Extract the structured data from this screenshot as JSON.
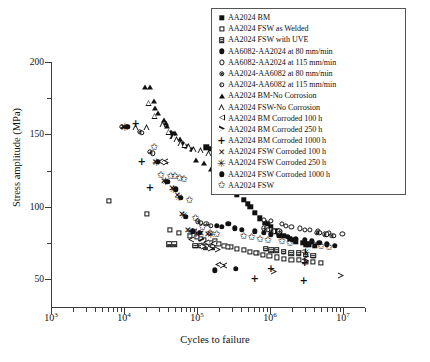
{
  "chart_data": {
    "type": "scatter",
    "title": "",
    "xlabel": "Cycles to failure",
    "ylabel": "Stress amplitude (MPa)",
    "xscale": "log",
    "yscale": "linear",
    "xlim": [
      1000,
      20000000
    ],
    "ylim": [
      30,
      200
    ],
    "grid": false,
    "legend_position": "top-right",
    "xticks": [
      {
        "value": 1000,
        "label": "10",
        "exp": "3"
      },
      {
        "value": 10000,
        "label": "10",
        "exp": "4"
      },
      {
        "value": 100000,
        "label": "10",
        "exp": "5"
      },
      {
        "value": 1000000,
        "label": "10",
        "exp": "6"
      },
      {
        "value": 10000000,
        "label": "10",
        "exp": "7"
      }
    ],
    "yticks_major": [
      50,
      100,
      150,
      200
    ],
    "yticks_minor": [
      75,
      125,
      175
    ],
    "series": [
      {
        "name": "AA2024 BM",
        "marker": "square-filled",
        "points": [
          [
            130000,
            141
          ],
          [
            150000,
            140
          ],
          [
            170000,
            134
          ],
          [
            210000,
            128
          ],
          [
            260000,
            120
          ],
          [
            300000,
            113
          ],
          [
            340000,
            108
          ],
          [
            420000,
            105
          ],
          [
            520000,
            100
          ],
          [
            600000,
            96
          ],
          [
            700000,
            92
          ],
          [
            820000,
            89
          ],
          [
            1000000,
            86
          ],
          [
            1200000,
            83
          ],
          [
            1500000,
            80
          ],
          [
            1800000,
            78
          ],
          [
            2200000,
            76
          ],
          [
            2700000,
            75
          ],
          [
            3300000,
            74
          ],
          [
            4000000,
            73
          ],
          [
            250000,
            122
          ],
          [
            330000,
            115
          ],
          [
            480000,
            102
          ],
          [
            900000,
            88
          ],
          [
            1300000,
            82
          ],
          [
            2000000,
            77
          ],
          [
            3000000,
            74
          ]
        ]
      },
      {
        "name": "AA2024 FSW as Welded",
        "marker": "square-open",
        "points": [
          [
            6000,
            104
          ],
          [
            20000,
            95
          ],
          [
            41000,
            84
          ],
          [
            55000,
            82
          ],
          [
            78000,
            80
          ],
          [
            96000,
            79
          ],
          [
            120000,
            77
          ],
          [
            150000,
            75
          ],
          [
            190000,
            74
          ],
          [
            230000,
            73
          ],
          [
            280000,
            72
          ],
          [
            340000,
            71
          ],
          [
            420000,
            70
          ],
          [
            520000,
            69
          ],
          [
            640000,
            68
          ],
          [
            780000,
            67
          ],
          [
            950000,
            66
          ],
          [
            1200000,
            65
          ],
          [
            1500000,
            64
          ],
          [
            1900000,
            63
          ],
          [
            2400000,
            63
          ],
          [
            3000000,
            62
          ],
          [
            3800000,
            62
          ],
          [
            4800000,
            61
          ],
          [
            110000,
            78
          ],
          [
            170000,
            76
          ],
          [
            260000,
            72
          ],
          [
            620000,
            68
          ]
        ]
      },
      {
        "name": "AA2024 FSW with UVE",
        "marker": "square-grid",
        "points": [
          [
            40000,
            74
          ],
          [
            47000,
            74
          ],
          [
            92000,
            73
          ],
          [
            110000,
            73
          ],
          [
            130000,
            72
          ],
          [
            160000,
            72
          ],
          [
            850000,
            71
          ],
          [
            1000000,
            70
          ],
          [
            1200000,
            70
          ],
          [
            1500000,
            69
          ],
          [
            1900000,
            68
          ],
          [
            2400000,
            68
          ],
          [
            3000000,
            67
          ],
          [
            3800000,
            66
          ]
        ]
      },
      {
        "name": "AA6082-AA2024 at 80 mm/min",
        "marker": "circle-filled",
        "points": [
          [
            180000,
            87
          ],
          [
            210000,
            86
          ],
          [
            320000,
            85
          ],
          [
            400000,
            84
          ],
          [
            600000,
            83
          ],
          [
            800000,
            82
          ],
          [
            1000000,
            81
          ],
          [
            1300000,
            80
          ],
          [
            1700000,
            79
          ],
          [
            2200000,
            78
          ],
          [
            2900000,
            77
          ],
          [
            3600000,
            76
          ],
          [
            4600000,
            75
          ],
          [
            5800000,
            74
          ],
          [
            7500000,
            73
          ],
          [
            330000,
            57
          ],
          [
            260000,
            88
          ]
        ]
      },
      {
        "name": "AA6082-AA2024 at 115 mm/min",
        "marker": "circle-open",
        "points": [
          [
            800000,
            91
          ],
          [
            1000000,
            90
          ],
          [
            1400000,
            88
          ],
          [
            1900000,
            86
          ],
          [
            2500000,
            85
          ],
          [
            3400000,
            84
          ],
          [
            4400000,
            83
          ],
          [
            6200000,
            82
          ],
          [
            9500000,
            81
          ],
          [
            1600000,
            87
          ],
          [
            2900000,
            84
          ]
        ]
      },
      {
        "name": "AA2024-AA6082 at 80 mm/min",
        "marker": "circle-plus",
        "points": [
          [
            9000,
            155
          ],
          [
            16000,
            152
          ],
          [
            22000,
            138
          ],
          [
            100000,
            90
          ],
          [
            130000,
            88
          ],
          [
            800000,
            85
          ],
          [
            1000000,
            84
          ],
          [
            1300000,
            83
          ],
          [
            4200000,
            82
          ],
          [
            5400000,
            81
          ],
          [
            6800000,
            80
          ]
        ]
      },
      {
        "name": "AA2024-AA6082 at 115 mm/min",
        "marker": "circle-half",
        "points": [
          [
            10500,
            155
          ],
          [
            17000,
            151
          ],
          [
            24000,
            137
          ],
          [
            110000,
            89
          ],
          [
            150000,
            87
          ],
          [
            900000,
            84
          ],
          [
            1100000,
            83
          ],
          [
            4600000,
            82
          ],
          [
            5800000,
            81
          ],
          [
            7200000,
            80
          ]
        ]
      },
      {
        "name": "AA2024 BM-No Corrosion",
        "marker": "triangle-filled",
        "points": [
          [
            19000,
            183
          ],
          [
            22000,
            183
          ],
          [
            25000,
            173
          ],
          [
            28000,
            165
          ],
          [
            34000,
            160
          ],
          [
            38000,
            156
          ],
          [
            42000,
            152
          ],
          [
            49000,
            151
          ],
          [
            56000,
            147
          ],
          [
            62000,
            144
          ],
          [
            70000,
            142
          ],
          [
            82000,
            140
          ],
          [
            95000,
            132
          ],
          [
            120000,
            130
          ],
          [
            150000,
            126
          ],
          [
            190000,
            124
          ],
          [
            250000,
            121
          ],
          [
            330000,
            118
          ],
          [
            420000,
            116
          ],
          [
            560000,
            114
          ],
          [
            700000,
            113
          ],
          [
            26000,
            168
          ],
          [
            36000,
            158
          ],
          [
            46000,
            151
          ]
        ]
      },
      {
        "name": "AA2024 FSW-No Corrosion",
        "marker": "triangle-open",
        "points": [
          [
            14000,
            155
          ],
          [
            20000,
            155
          ],
          [
            21000,
            172
          ],
          [
            26000,
            163
          ],
          [
            33000,
            157
          ],
          [
            40000,
            152
          ],
          [
            46000,
            149
          ],
          [
            52000,
            147
          ],
          [
            58000,
            144
          ],
          [
            66000,
            143
          ],
          [
            74000,
            142
          ],
          [
            88000,
            140
          ],
          [
            110000,
            139
          ],
          [
            140000,
            137
          ],
          [
            180000,
            136
          ],
          [
            400000,
            133
          ],
          [
            1500000,
            130
          ],
          [
            8000000,
            115
          ]
        ]
      },
      {
        "name": "AA2024 BM Corroded 100 h",
        "marker": "triangle-left",
        "points": [
          [
            30000,
            131
          ],
          [
            35000,
            131
          ],
          [
            80000,
            77
          ],
          [
            110000,
            76
          ],
          [
            130000,
            75
          ],
          [
            160000,
            74
          ],
          [
            2700000,
            69
          ],
          [
            3000000,
            64
          ],
          [
            190000,
            60
          ],
          [
            230000,
            59
          ]
        ]
      },
      {
        "name": "AA2024 BM Corroded 250 h",
        "marker": "triangle-right",
        "points": [
          [
            36000,
            130
          ],
          [
            120000,
            72
          ],
          [
            150000,
            71
          ],
          [
            185000,
            70
          ],
          [
            220000,
            59
          ],
          [
            2900000,
            62
          ],
          [
            1100000,
            55
          ],
          [
            9000000,
            52
          ]
        ]
      },
      {
        "name": "AA2024 BM Corroded 1000 h",
        "marker": "plus",
        "points": [
          [
            14000,
            157
          ],
          [
            17000,
            131
          ],
          [
            22000,
            113
          ],
          [
            1000000,
            57
          ],
          [
            2900000,
            61
          ],
          [
            600000,
            50
          ],
          [
            2800000,
            49
          ]
        ]
      },
      {
        "name": "AA2024 FSW Corroded 100 h",
        "marker": "cross",
        "points": [
          [
            9500,
            155
          ],
          [
            26000,
            131
          ],
          [
            34000,
            118
          ],
          [
            44000,
            113
          ],
          [
            52000,
            108
          ],
          [
            60000,
            95
          ],
          [
            72000,
            84
          ],
          [
            90000,
            83
          ],
          [
            110000,
            82
          ],
          [
            135000,
            81
          ]
        ]
      },
      {
        "name": "AA2024 FSW Corroded 250 h",
        "marker": "asterisk",
        "points": [
          [
            10000,
            155
          ],
          [
            27000,
            131
          ],
          [
            36000,
            118
          ],
          [
            46000,
            112
          ],
          [
            55000,
            107
          ],
          [
            64000,
            94
          ],
          [
            78000,
            83
          ],
          [
            96000,
            82
          ],
          [
            150000,
            81
          ],
          [
            3000000,
            69
          ]
        ]
      },
      {
        "name": "AA2024 FSW Corroded 1000 h",
        "marker": "circle-ball",
        "points": [
          [
            11000,
            155
          ],
          [
            28000,
            131
          ],
          [
            38000,
            117
          ],
          [
            50000,
            112
          ],
          [
            58000,
            106
          ],
          [
            68000,
            93
          ],
          [
            85000,
            83
          ],
          [
            105000,
            82
          ],
          [
            170000,
            56
          ]
        ]
      },
      {
        "name": "AA2024 FSW",
        "marker": "star",
        "points": [
          [
            25000,
            141
          ],
          [
            31000,
            122
          ],
          [
            42000,
            121
          ],
          [
            48000,
            121
          ],
          [
            56000,
            120
          ],
          [
            64000,
            119
          ],
          [
            76000,
            105
          ],
          [
            92000,
            92
          ],
          [
            115000,
            86
          ],
          [
            145000,
            82
          ],
          [
            180000,
            81
          ],
          [
            420000,
            80
          ],
          [
            540000,
            79
          ],
          [
            700000,
            78
          ],
          [
            900000,
            77
          ],
          [
            1400000,
            76
          ],
          [
            1800000,
            75
          ],
          [
            3800000,
            74
          ],
          [
            4800000,
            73
          ],
          [
            6200000,
            72
          ]
        ]
      }
    ]
  },
  "legend": {
    "items": [
      {
        "marker": "square-filled",
        "label": "AA2024 BM"
      },
      {
        "marker": "square-open",
        "label": "AA2024 FSW as Welded"
      },
      {
        "marker": "square-grid",
        "label": "AA2024 FSW with UVE"
      },
      {
        "marker": "circle-filled",
        "label": "AA6082-AA2024 at 80 mm/min"
      },
      {
        "marker": "circle-open",
        "label": "AA6082-AA2024 at 115 mm/min"
      },
      {
        "marker": "circle-plus",
        "label": "AA2024-AA6082 at 80 mm/min"
      },
      {
        "marker": "circle-half",
        "label": "AA2024-AA6082 at 115 mm/min"
      },
      {
        "marker": "triangle-filled",
        "label": "AA2024 BM-No Corrosion"
      },
      {
        "marker": "triangle-open",
        "label": "AA2024 FSW-No Corrosion"
      },
      {
        "marker": "triangle-left",
        "label": "AA2024 BM Corroded 100 h"
      },
      {
        "marker": "triangle-right",
        "label": "AA2024 BM Corroded 250 h"
      },
      {
        "marker": "plus",
        "label": "AA2024 BM Corroded 1000 h"
      },
      {
        "marker": "cross",
        "label": "AA2024 FSW Corroded 100 h"
      },
      {
        "marker": "asterisk",
        "label": "AA2024 FSW Corroded 250 h"
      },
      {
        "marker": "circle-ball",
        "label": "AA2024 FSW Corroded 1000 h"
      },
      {
        "marker": "star",
        "label": "AA2024 FSW"
      }
    ]
  },
  "colors": {
    "ink": "#111111",
    "axis": "#3a3a3a",
    "background": "#ffffff"
  }
}
